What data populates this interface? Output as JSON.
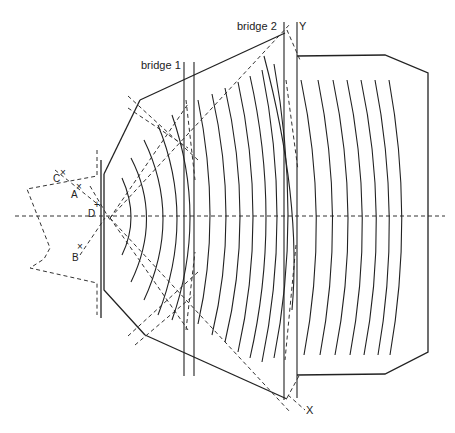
{
  "diagram": {
    "type": "line-drawing",
    "labels": {
      "bridge1": "bridge 1",
      "bridge2": "bridge 2",
      "point_y": "Y",
      "point_x": "X",
      "point_a": "A",
      "point_b": "B",
      "point_c": "C",
      "point_d": "D"
    },
    "colors": {
      "line": "#222222",
      "background": "#ffffff"
    },
    "elements": {
      "wave_fronts_section1": 5,
      "wave_fronts_section2": 9,
      "wave_fronts_section3": 7,
      "centerline": "horizontal dashed axis at y≈216"
    }
  }
}
